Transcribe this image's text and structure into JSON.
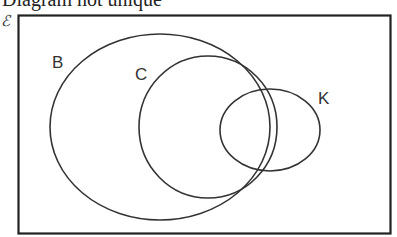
{
  "title": "Diagram not unique",
  "universal_set_symbol": "ℰ",
  "diagram": {
    "type": "venn",
    "stroke_color": "#333333",
    "frame_color": "#222222",
    "sets": [
      {
        "label": "B",
        "description": "large set containing C"
      },
      {
        "label": "C",
        "description": "subset of B, touching B on the right"
      },
      {
        "label": "K",
        "description": "set overlapping both B and C"
      }
    ]
  }
}
